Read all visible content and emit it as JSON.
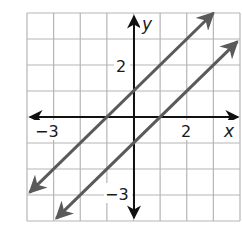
{
  "chart_data": {
    "type": "line",
    "title": "",
    "xlabel": "x",
    "ylabel": "y",
    "xlim": [
      -4,
      4
    ],
    "ylim": [
      -4,
      4
    ],
    "grid": true,
    "grid_step": 1,
    "x_tick_labels": [
      {
        "value": -3,
        "text": "−3"
      },
      {
        "value": 2,
        "text": "2"
      }
    ],
    "y_tick_labels": [
      {
        "value": 2,
        "text": "2"
      },
      {
        "value": -3,
        "text": "−3"
      }
    ],
    "series": [
      {
        "name": "line-1",
        "equation": "y = x + 1",
        "slope": 1,
        "intercept": 1,
        "x": [
          -3.9,
          3.0
        ],
        "y": [
          -2.9,
          4.0
        ],
        "arrows": "both",
        "color": "#5a5a5a"
      },
      {
        "name": "line-2",
        "equation": "y = x - 1",
        "slope": 1,
        "intercept": -1,
        "x": [
          -2.9,
          3.9
        ],
        "y": [
          -3.9,
          2.9
        ],
        "arrows": "both",
        "color": "#5a5a5a"
      }
    ],
    "legend": null
  },
  "labels": {
    "x_axis": "x",
    "y_axis": "y",
    "x_neg3": "−3",
    "x_2": "2",
    "y_2": "2",
    "y_neg3": "−3"
  },
  "colors": {
    "grid": "#b5b5b5",
    "axis": "#111111",
    "line": "#5a5a5a"
  }
}
